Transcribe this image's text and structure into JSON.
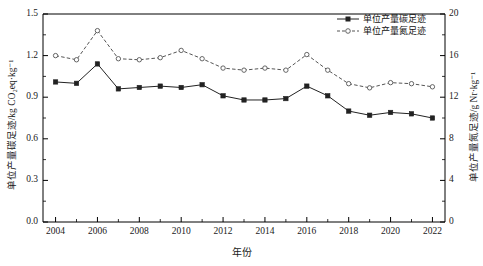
{
  "chart_data": {
    "type": "line",
    "title": "",
    "xlabel": "年份",
    "ylabel": "单位产量碳足迹/kg CO₂eq·kg⁻¹",
    "y2label": "单位产量氮足迹/g Nr·kg⁻¹",
    "x": [
      2004,
      2005,
      2006,
      2007,
      2008,
      2009,
      2010,
      2011,
      2012,
      2013,
      2014,
      2015,
      2016,
      2017,
      2018,
      2019,
      2020,
      2021,
      2022
    ],
    "xlim": [
      2003.4,
      2022.6
    ],
    "ylim": [
      0.0,
      1.5
    ],
    "y2lim": [
      0,
      20
    ],
    "yticks": [
      "0.0",
      "0.3",
      "0.6",
      "0.9",
      "1.2",
      "1.5"
    ],
    "ytick_values": [
      0.0,
      0.3,
      0.6,
      0.9,
      1.2,
      1.5
    ],
    "y2ticks": [
      "0",
      "4",
      "8",
      "12",
      "16",
      "20"
    ],
    "y2tick_values": [
      0,
      4,
      8,
      12,
      16,
      20
    ],
    "xticks": [
      "2004",
      "2006",
      "2008",
      "2010",
      "2012",
      "2014",
      "2016",
      "2018",
      "2020",
      "2022"
    ],
    "xtick_values": [
      2004,
      2006,
      2008,
      2010,
      2012,
      2014,
      2016,
      2018,
      2020,
      2022
    ],
    "grid": false,
    "legend_position": "top-right",
    "series": [
      {
        "name": "单位产量碳足迹",
        "axis": "left",
        "style": "solid",
        "marker": "filled-square",
        "color": "#222222",
        "values": [
          1.01,
          1.0,
          1.14,
          0.96,
          0.97,
          0.98,
          0.97,
          0.99,
          0.91,
          0.88,
          0.88,
          0.89,
          0.98,
          0.91,
          0.8,
          0.77,
          0.79,
          0.78,
          0.75
        ]
      },
      {
        "name": "单位产量氮足迹",
        "axis": "right",
        "style": "dashed",
        "marker": "open-circle",
        "color": "#555555",
        "values": [
          16.0,
          15.6,
          18.4,
          15.7,
          15.6,
          15.8,
          16.5,
          15.7,
          14.8,
          14.6,
          14.8,
          14.6,
          16.1,
          14.6,
          13.3,
          12.9,
          13.4,
          13.3,
          13.0
        ]
      }
    ]
  },
  "legend": {
    "items": [
      {
        "label": "单位产量碳足迹"
      },
      {
        "label": "单位产量氮足迹"
      }
    ]
  },
  "axes": {
    "x_title": "年份",
    "y_left_title": "单位产量碳足迹/kg CO₂eq·kg⁻¹",
    "y_right_title": "单位产量氮足迹/g Nr·kg⁻¹"
  },
  "colors": {
    "carbon_line": "#222222",
    "nitrogen_line": "#555555",
    "axis": "#000000",
    "background": "#ffffff"
  }
}
